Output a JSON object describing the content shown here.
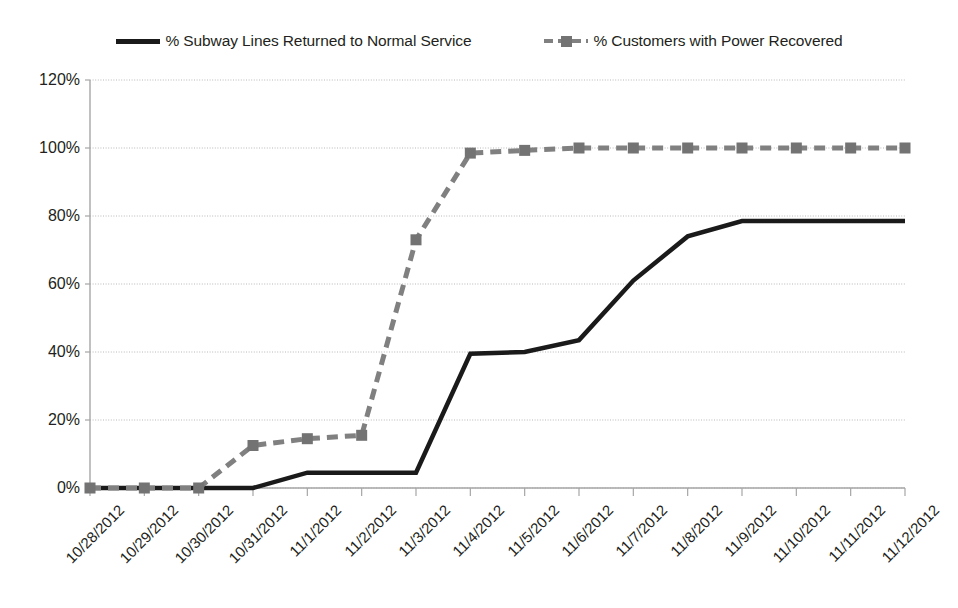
{
  "legend": {
    "position": "top-center",
    "entries": [
      {
        "label": "% Subway Lines Returned to Normal Service",
        "style": "solid",
        "color": "#1a1a1a",
        "marker": "none",
        "icon": "solid-line-swatch-icon"
      },
      {
        "label": "% Customers with Power Recovered",
        "style": "dashed",
        "color": "#808080",
        "marker": "square",
        "icon": "dashed-line-square-marker-swatch-icon"
      }
    ]
  },
  "chart_data": {
    "type": "line",
    "title": "",
    "subtitle": "",
    "xlabel": "",
    "ylabel": "",
    "ylim": [
      0,
      120
    ],
    "yticks": [
      0,
      20,
      40,
      60,
      80,
      100,
      120
    ],
    "ytick_labels": [
      "0%",
      "20%",
      "40%",
      "60%",
      "80%",
      "100%",
      "120%"
    ],
    "grid": true,
    "grid_axis": "y",
    "legend_position": "top-center",
    "categories": [
      "10/28/2012",
      "10/29/2012",
      "10/30/2012",
      "10/31/2012",
      "11/1/2012",
      "11/2/2012",
      "11/3/2012",
      "11/4/2012",
      "11/5/2012",
      "11/6/2012",
      "11/7/2012",
      "11/8/2012",
      "11/9/2012",
      "11/10/2012",
      "11/11/2012",
      "11/12/2012"
    ],
    "series": [
      {
        "name": "% Subway Lines Returned to Normal Service",
        "color": "#1a1a1a",
        "style": "solid",
        "marker": "none",
        "values": [
          0,
          0,
          0,
          0,
          4.5,
          4.5,
          4.5,
          39.5,
          40,
          43.5,
          61,
          74,
          78.5,
          78.5,
          78.5,
          78.5
        ]
      },
      {
        "name": "% Customers with Power Recovered",
        "color": "#808080",
        "style": "dashed",
        "marker": "square",
        "values": [
          0,
          0,
          0,
          12.5,
          14.5,
          15.5,
          73,
          98.5,
          99.3,
          100,
          100,
          100,
          100,
          100,
          100,
          100
        ]
      }
    ]
  }
}
